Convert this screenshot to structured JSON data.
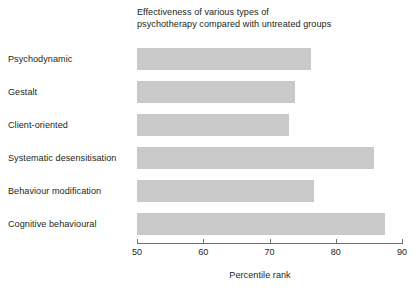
{
  "chart_data": {
    "type": "bar",
    "orientation": "horizontal",
    "title": "Effectiveness of various types of psychotherapy compared with untreated groups",
    "title_lines": [
      "Effectiveness of various types of",
      "psychotherapy compared with untreated groups"
    ],
    "categories": [
      "Psychodynamic",
      "Gestalt",
      "Client-oriented",
      "Systematic desensitisation",
      "Behaviour modification",
      "Cognitive behavioural"
    ],
    "values": [
      76.3,
      73.8,
      73.0,
      85.8,
      76.7,
      87.5
    ],
    "xlabel": "Percentile rank",
    "ylabel": "",
    "xlim": [
      50,
      90
    ],
    "xticks": [
      50,
      60,
      70,
      80,
      90
    ],
    "xticklabels": [
      "50",
      "60",
      "70",
      "80",
      "90"
    ],
    "grid": false,
    "legend": false,
    "bar_color": "#c9c9c9",
    "axis_color": "#6d6e71",
    "text_color": "#231f20",
    "background": "#ffffff"
  }
}
